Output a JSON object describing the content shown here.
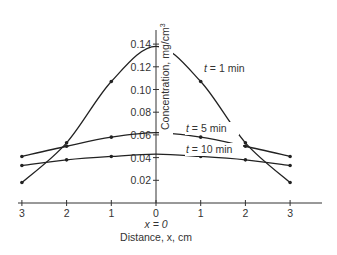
{
  "chart_data": {
    "type": "line",
    "title": "",
    "xlabel": "Distance, x, cm",
    "xlabel_sub": "x = 0",
    "ylabel": "Concentration, mg/cm3",
    "x": [
      -3,
      -2,
      -1,
      0,
      1,
      2,
      3
    ],
    "x_tick_labels": [
      "3",
      "2",
      "1",
      "0",
      "1",
      "2",
      "3"
    ],
    "y_ticks": [
      0.02,
      0.04,
      0.06,
      0.08,
      0.1,
      0.12,
      0.14
    ],
    "y_tick_labels": [
      "0.02",
      "0.04",
      "0.06",
      "0.08",
      "0.10",
      "0.12",
      "0.14"
    ],
    "ylim": [
      0,
      0.15
    ],
    "xlim": [
      -3.4,
      3.5
    ],
    "grid": false,
    "legend": "inline labels",
    "series": [
      {
        "name": "t = 1 min",
        "values": [
          0.018,
          0.053,
          0.107,
          0.138,
          0.107,
          0.053,
          0.018
        ]
      },
      {
        "name": "t = 5 min",
        "values": [
          0.041,
          0.05,
          0.058,
          0.062,
          0.058,
          0.05,
          0.041
        ]
      },
      {
        "name": "t = 10 min",
        "values": [
          0.033,
          0.038,
          0.041,
          0.043,
          0.041,
          0.038,
          0.033
        ]
      }
    ]
  },
  "labels": {
    "ylabel_main": "Concentration, mg/cm",
    "ylabel_sup": "3",
    "x_origin": "x = 0",
    "xlabel": "Distance, x, cm",
    "series_labels": [
      {
        "t": "t",
        "rest": " = 1 min"
      },
      {
        "t": "t",
        "rest": " = 5 min"
      },
      {
        "t": "t",
        "rest": " = 10 min"
      }
    ]
  }
}
